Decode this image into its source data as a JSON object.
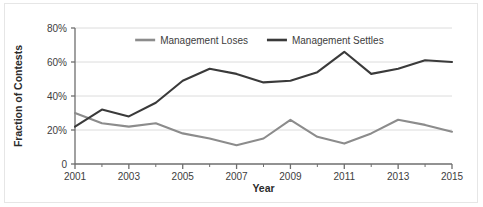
{
  "chart_data": {
    "type": "line",
    "title": "",
    "xlabel": "Year",
    "ylabel": "Fraction of Contests",
    "x": [
      2001,
      2002,
      2003,
      2004,
      2005,
      2006,
      2007,
      2008,
      2009,
      2010,
      2011,
      2012,
      2013,
      2014,
      2015
    ],
    "xlim": [
      2001,
      2015
    ],
    "ylim": [
      0,
      80
    ],
    "xticks": [
      2001,
      2003,
      2005,
      2007,
      2009,
      2011,
      2013,
      2015
    ],
    "xtick_labels": [
      "2001",
      "2003",
      "2005",
      "2007",
      "2009",
      "2011",
      "2013",
      "2015"
    ],
    "xminor_ticks": [
      2002,
      2004,
      2006,
      2008,
      2010,
      2012,
      2014
    ],
    "yticks": [
      0,
      20,
      40,
      60,
      80
    ],
    "ytick_labels": [
      "0",
      "20%",
      "40%",
      "60%",
      "80%"
    ],
    "grid": "horizontal",
    "legend_position": "top-center",
    "series": [
      {
        "name": "Management Loses",
        "color": "#8c8c8c",
        "values": [
          30,
          24,
          22,
          24,
          18,
          15,
          11,
          15,
          26,
          16,
          12,
          18,
          26,
          23,
          19
        ]
      },
      {
        "name": "Management Settles",
        "color": "#3a3a3a",
        "values": [
          22,
          32,
          28,
          36,
          49,
          56,
          53,
          48,
          49,
          54,
          66,
          53,
          56,
          61,
          60
        ]
      }
    ]
  },
  "axis": {
    "x_title": "Year",
    "y_title": "Fraction of Contests"
  },
  "colors": {
    "loses_line": "#8c8c8c",
    "settles_line": "#3a3a3a",
    "grid": "#dcdcdc",
    "axis": "#6e6e6e",
    "text": "#3d3d3d",
    "background": "#ffffff"
  }
}
